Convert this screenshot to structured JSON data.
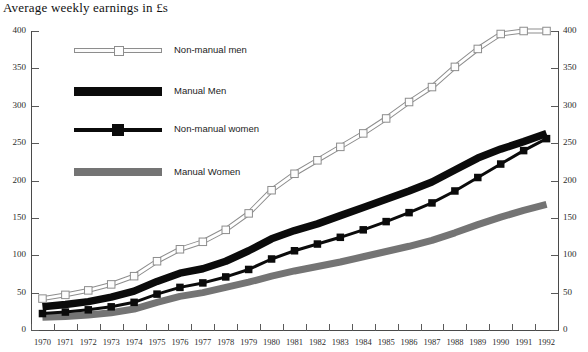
{
  "chart_data": {
    "type": "line",
    "title": "Average weekly earnings in £s",
    "xlabel": "",
    "ylabel": "",
    "ylim": [
      0,
      400
    ],
    "yticks": [
      0,
      50,
      100,
      150,
      200,
      250,
      300,
      350,
      400
    ],
    "grid": false,
    "legend_position": "upper-left-inside",
    "x": [
      1970,
      1971,
      1972,
      1973,
      1974,
      1975,
      1976,
      1977,
      1978,
      1979,
      1980,
      1981,
      1982,
      1983,
      1984,
      1985,
      1986,
      1987,
      1988,
      1989,
      1990,
      1991,
      1992
    ],
    "series": [
      {
        "name": "Non-manual men",
        "color": "#8d8d8d",
        "marker": "open-square",
        "values": [
          42,
          47,
          53,
          61,
          72,
          92,
          108,
          118,
          134,
          156,
          187,
          209,
          227,
          245,
          263,
          283,
          305,
          325,
          352,
          376,
          396,
          400,
          400
        ]
      },
      {
        "name": "Manual Men",
        "color": "#0b0b0b",
        "marker": "none",
        "values": [
          31,
          34,
          38,
          44,
          52,
          65,
          76,
          82,
          92,
          106,
          122,
          133,
          142,
          153,
          164,
          175,
          186,
          198,
          214,
          230,
          242,
          252,
          263
        ]
      },
      {
        "name": "Non-manual women",
        "color": "#0b0b0b",
        "marker": "filled-square",
        "values": [
          22,
          24,
          27,
          31,
          37,
          48,
          57,
          63,
          71,
          81,
          95,
          106,
          115,
          124,
          134,
          145,
          157,
          170,
          186,
          204,
          222,
          240,
          256
        ]
      },
      {
        "name": "Manual Women",
        "color": "#747474",
        "marker": "none",
        "values": [
          17,
          18,
          20,
          23,
          28,
          37,
          45,
          50,
          57,
          64,
          72,
          79,
          85,
          91,
          98,
          105,
          112,
          120,
          130,
          141,
          151,
          160,
          168
        ]
      }
    ]
  },
  "axes": {
    "left_tick_labels": [
      "400",
      "350",
      "300",
      "250",
      "200",
      "150",
      "100",
      "50",
      "0"
    ],
    "right_tick_labels": [
      "400",
      "350",
      "300",
      "250",
      "200",
      "150",
      "100",
      "50",
      "0"
    ],
    "x_tick_labels": [
      "1970",
      "1971",
      "1972",
      "1973",
      "1974",
      "1975",
      "1976",
      "1977",
      "1978",
      "1979",
      "1980",
      "1981",
      "1982",
      "1983",
      "1984",
      "1985",
      "1986",
      "1987",
      "1988",
      "1989",
      "1990",
      "1991",
      "1992"
    ]
  },
  "legend": {
    "items": [
      {
        "label": "Non-manual men"
      },
      {
        "label": "Manual Men"
      },
      {
        "label": "Non-manual women"
      },
      {
        "label": "Manual Women"
      }
    ]
  }
}
